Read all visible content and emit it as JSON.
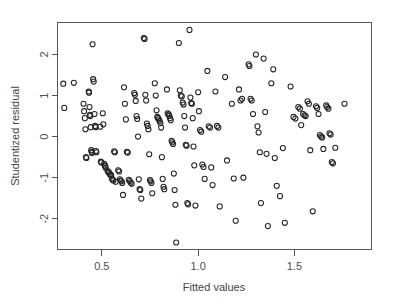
{
  "chart_data": {
    "type": "scatter",
    "title": "",
    "xlabel": "Fitted values",
    "ylabel": "Studentized residual",
    "xlim": [
      0.27,
      1.9
    ],
    "ylim": [
      -2.75,
      2.78
    ],
    "grid": false,
    "legend": null,
    "marker": "open-circle",
    "x_ticks": [
      0.5,
      1.0,
      1.5
    ],
    "x_tick_labels": [
      "0.5",
      "1.0",
      "1.5"
    ],
    "y_ticks": [
      2,
      1,
      0,
      -1,
      -2
    ],
    "y_tick_labels": [
      "2",
      "1",
      "0",
      "-1",
      "-2"
    ],
    "n_points": 197,
    "points": [
      [
        0.3,
        1.29
      ],
      [
        0.305,
        0.7
      ],
      [
        0.355,
        1.31
      ],
      [
        0.405,
        0.8
      ],
      [
        0.408,
        0.62
      ],
      [
        0.412,
        0.45
      ],
      [
        0.415,
        0.18
      ],
      [
        0.418,
        -0.5
      ],
      [
        0.42,
        -0.52
      ],
      [
        0.432,
        1.1
      ],
      [
        0.434,
        1.07
      ],
      [
        0.436,
        0.72
      ],
      [
        0.438,
        0.53
      ],
      [
        0.44,
        0.5
      ],
      [
        0.442,
        0.23
      ],
      [
        0.445,
        -0.33
      ],
      [
        0.447,
        -0.37
      ],
      [
        0.449,
        -0.4
      ],
      [
        0.452,
        2.25
      ],
      [
        0.455,
        1.4
      ],
      [
        0.458,
        1.34
      ],
      [
        0.462,
        0.55
      ],
      [
        0.465,
        0.26
      ],
      [
        0.468,
        0.23
      ],
      [
        0.47,
        -0.35
      ],
      [
        0.472,
        -0.38
      ],
      [
        0.492,
        0.24
      ],
      [
        0.495,
        -0.61
      ],
      [
        0.498,
        -0.63
      ],
      [
        0.505,
        0.57
      ],
      [
        0.508,
        0.3
      ],
      [
        0.512,
        -0.66
      ],
      [
        0.515,
        -0.7
      ],
      [
        0.518,
        -0.72
      ],
      [
        0.52,
        -0.76
      ],
      [
        0.53,
        -0.84
      ],
      [
        0.534,
        -0.86
      ],
      [
        0.538,
        -0.88
      ],
      [
        0.542,
        -0.92
      ],
      [
        0.548,
        -0.93
      ],
      [
        0.552,
        -1.02
      ],
      [
        0.556,
        -1.05
      ],
      [
        0.56,
        -1.07
      ],
      [
        0.564,
        -0.36
      ],
      [
        0.568,
        -0.38
      ],
      [
        0.572,
        -1.1
      ],
      [
        0.585,
        -0.82
      ],
      [
        0.59,
        -0.85
      ],
      [
        0.594,
        -1.04
      ],
      [
        0.598,
        -1.07
      ],
      [
        0.602,
        -1.09
      ],
      [
        0.606,
        -1.13
      ],
      [
        0.61,
        -1.42
      ],
      [
        0.615,
        1.2
      ],
      [
        0.62,
        0.8
      ],
      [
        0.625,
        0.42
      ],
      [
        0.63,
        -0.37
      ],
      [
        0.635,
        -0.39
      ],
      [
        0.64,
        -1.05
      ],
      [
        0.645,
        -1.08
      ],
      [
        0.65,
        -1.12
      ],
      [
        0.655,
        -1.15
      ],
      [
        0.668,
        1.06
      ],
      [
        0.672,
        1.02
      ],
      [
        0.676,
        0.87
      ],
      [
        0.68,
        0.5
      ],
      [
        0.684,
        0.43
      ],
      [
        0.688,
        0.0
      ],
      [
        0.692,
        -1.04
      ],
      [
        0.696,
        -1.28
      ],
      [
        0.7,
        -1.3
      ],
      [
        0.705,
        -1.51
      ],
      [
        0.718,
        2.4
      ],
      [
        0.722,
        2.38
      ],
      [
        0.726,
        1.02
      ],
      [
        0.73,
        0.88
      ],
      [
        0.734,
        0.32
      ],
      [
        0.738,
        0.26
      ],
      [
        0.742,
        0.18
      ],
      [
        0.746,
        -0.43
      ],
      [
        0.75,
        -1.06
      ],
      [
        0.754,
        -1.09
      ],
      [
        0.758,
        -1.13
      ],
      [
        0.762,
        -1.38
      ],
      [
        0.775,
        1.3
      ],
      [
        0.78,
        1.0
      ],
      [
        0.784,
        0.64
      ],
      [
        0.788,
        0.48
      ],
      [
        0.792,
        0.45
      ],
      [
        0.796,
        0.42
      ],
      [
        0.8,
        0.38
      ],
      [
        0.804,
        0.33
      ],
      [
        0.808,
        0.22
      ],
      [
        0.812,
        -0.5
      ],
      [
        0.816,
        -1.03
      ],
      [
        0.82,
        -1.22
      ],
      [
        0.824,
        -1.28
      ],
      [
        0.838,
        1.15
      ],
      [
        0.842,
        0.57
      ],
      [
        0.846,
        0.54
      ],
      [
        0.85,
        0.51
      ],
      [
        0.854,
        0.45
      ],
      [
        0.858,
        0.4
      ],
      [
        0.862,
        -0.1
      ],
      [
        0.866,
        -0.14
      ],
      [
        0.87,
        -0.18
      ],
      [
        0.874,
        -0.9
      ],
      [
        0.878,
        -1.3
      ],
      [
        0.882,
        -1.66
      ],
      [
        0.886,
        -2.58
      ],
      [
        0.9,
        2.28
      ],
      [
        0.905,
        1.13
      ],
      [
        0.91,
        1.0
      ],
      [
        0.915,
        0.98
      ],
      [
        0.92,
        0.83
      ],
      [
        0.924,
        0.78
      ],
      [
        0.928,
        0.5
      ],
      [
        0.932,
        0.22
      ],
      [
        0.936,
        -0.2
      ],
      [
        0.94,
        -0.22
      ],
      [
        0.944,
        -1.62
      ],
      [
        0.948,
        -1.65
      ],
      [
        0.955,
        2.6
      ],
      [
        0.96,
        0.95
      ],
      [
        0.964,
        0.82
      ],
      [
        0.968,
        0.8
      ],
      [
        0.972,
        0.45
      ],
      [
        0.976,
        -0.24
      ],
      [
        0.98,
        -0.7
      ],
      [
        0.986,
        -1.68
      ],
      [
        1.0,
        1.08
      ],
      [
        1.004,
        0.62
      ],
      [
        1.01,
        0.16
      ],
      [
        1.016,
        0.12
      ],
      [
        1.022,
        -0.68
      ],
      [
        1.028,
        -0.74
      ],
      [
        1.034,
        -1.03
      ],
      [
        1.048,
        1.6
      ],
      [
        1.055,
        0.25
      ],
      [
        1.062,
        0.22
      ],
      [
        1.068,
        -0.75
      ],
      [
        1.075,
        -1.18
      ],
      [
        1.09,
        1.1
      ],
      [
        1.098,
        0.26
      ],
      [
        1.105,
        0.22
      ],
      [
        1.112,
        -1.7
      ],
      [
        1.14,
        1.45
      ],
      [
        1.15,
        -0.58
      ],
      [
        1.175,
        0.8
      ],
      [
        1.185,
        -1.02
      ],
      [
        1.195,
        -2.05
      ],
      [
        1.212,
        1.15
      ],
      [
        1.22,
        0.88
      ],
      [
        1.228,
        0.92
      ],
      [
        1.235,
        -1.0
      ],
      [
        1.262,
        1.76
      ],
      [
        1.266,
        1.72
      ],
      [
        1.272,
        0.92
      ],
      [
        1.278,
        0.88
      ],
      [
        1.285,
        0.55
      ],
      [
        1.3,
        2.0
      ],
      [
        1.308,
        0.25
      ],
      [
        1.314,
        0.1
      ],
      [
        1.32,
        -0.38
      ],
      [
        1.326,
        -1.62
      ],
      [
        1.34,
        1.9
      ],
      [
        1.348,
        0.6
      ],
      [
        1.355,
        -0.42
      ],
      [
        1.362,
        -2.18
      ],
      [
        1.38,
        1.3
      ],
      [
        1.39,
        1.64
      ],
      [
        1.398,
        -0.52
      ],
      [
        1.408,
        -1.2
      ],
      [
        1.425,
        -1.45
      ],
      [
        1.44,
        -0.28
      ],
      [
        1.45,
        -2.1
      ],
      [
        1.48,
        1.22
      ],
      [
        1.495,
        0.48
      ],
      [
        1.505,
        0.44
      ],
      [
        1.52,
        0.72
      ],
      [
        1.528,
        0.68
      ],
      [
        1.535,
        0.28
      ],
      [
        1.545,
        0.55
      ],
      [
        1.552,
        0.52
      ],
      [
        1.558,
        0.5
      ],
      [
        1.568,
        0.86
      ],
      [
        1.575,
        0.8
      ],
      [
        1.582,
        -0.33
      ],
      [
        1.595,
        -1.82
      ],
      [
        1.612,
        0.74
      ],
      [
        1.618,
        0.7
      ],
      [
        1.625,
        0.55
      ],
      [
        1.632,
        0.04
      ],
      [
        1.638,
        0.0
      ],
      [
        1.644,
        -0.02
      ],
      [
        1.65,
        -0.3
      ],
      [
        1.665,
        0.76
      ],
      [
        1.67,
        0.72
      ],
      [
        1.676,
        0.68
      ],
      [
        1.682,
        0.08
      ],
      [
        1.688,
        0.05
      ],
      [
        1.694,
        -0.62
      ],
      [
        1.7,
        -0.65
      ],
      [
        1.712,
        -0.27
      ],
      [
        1.76,
        0.8
      ]
    ]
  },
  "axes": {
    "x_title": "Fitted values",
    "y_title": "Studentized residual"
  }
}
